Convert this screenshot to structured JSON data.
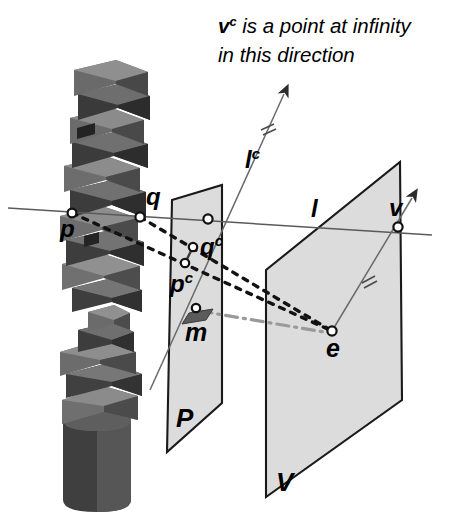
{
  "figure": {
    "caption": {
      "line1_symbol": "v",
      "line1_sup": "c",
      "line1_rest": " is a point at infinity",
      "line2": "in this direction"
    },
    "colors": {
      "background": "#ffffff",
      "plane_fill": "#dcdcdc",
      "plane_stroke": "#1a1a1a",
      "line_stroke": "#555555",
      "dotted_stroke": "#111111",
      "dashdot_stroke": "#9a9a9a",
      "label_color": "#000000",
      "sculpture_light": "#8a8a8a",
      "sculpture_mid": "#6e6e6e",
      "sculpture_dark": "#4a4a4a",
      "sculpture_darkest": "#3a3a3a",
      "marker_fill": "#ffffff"
    },
    "planes": [
      {
        "id": "P",
        "label": "P",
        "label_x": 179,
        "label_y": 424
      },
      {
        "id": "V",
        "label": "V",
        "label_y": 488,
        "label_x": 279
      }
    ],
    "points": [
      {
        "id": "p",
        "label": "p",
        "sup": "",
        "x": 72,
        "y": 213,
        "label_x": 60,
        "label_y": 237
      },
      {
        "id": "q",
        "label": "q",
        "sup": "",
        "x": 140,
        "y": 217,
        "label_x": 146,
        "label_y": 205
      },
      {
        "id": "qc",
        "label": "q",
        "sup": "c",
        "x": 193,
        "y": 247,
        "label_x": 200,
        "label_y": 252
      },
      {
        "id": "pc",
        "label": "p",
        "sup": "c",
        "x": 185,
        "y": 263,
        "label_x": 172,
        "label_y": 290
      },
      {
        "id": "lp",
        "label": "",
        "sup": "",
        "x": 208,
        "y": 219,
        "label_x": 0,
        "label_y": 0
      },
      {
        "id": "m",
        "label": "m",
        "sup": "",
        "x": 196,
        "y": 308,
        "label_x": 186,
        "label_y": 340
      },
      {
        "id": "v",
        "label": "v",
        "sup": "",
        "x": 398,
        "y": 227,
        "label_x": 388,
        "label_y": 214
      },
      {
        "id": "e",
        "label": "e",
        "sup": "",
        "x": 332,
        "y": 331,
        "label_x": 327,
        "label_y": 356
      }
    ],
    "lines": [
      {
        "id": "l",
        "label": "l",
        "sup": "",
        "label_x": 313,
        "label_y": 215,
        "style": "solid"
      },
      {
        "id": "lc",
        "label": "l",
        "sup": "c",
        "label_x": 249,
        "label_y": 163,
        "style": "solid"
      }
    ],
    "tick_marks": [
      {
        "on": "lc",
        "count": 2,
        "x": 268,
        "y": 127
      },
      {
        "on": "ve",
        "count": 2,
        "x": 368,
        "y": 278
      }
    ],
    "arrows": [
      {
        "id": "lc-arrow",
        "tip_x": 288,
        "tip_y": 88
      },
      {
        "id": "v-arrow",
        "tip_x": 416,
        "tip_y": 192
      }
    ]
  }
}
